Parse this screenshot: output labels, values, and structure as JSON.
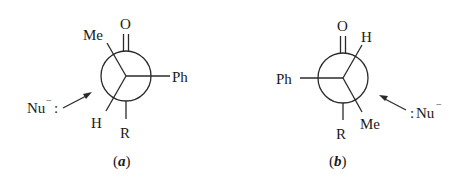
{
  "figure": {
    "panels": [
      {
        "id": "a",
        "caption_letter": "a",
        "caption_open": "(",
        "caption_close": ")",
        "front_carbon": "carbonyl (C=O)",
        "labels": {
          "top": "O",
          "back_upper_left": "Me",
          "back_right": "Ph",
          "front_lower_left": "H",
          "back_bottom": "R",
          "nucleophile": "Nu",
          "nucleophile_charge": "−",
          "nucleophile_lone_pair": ":"
        },
        "attack_direction": "from lower-left toward circle"
      },
      {
        "id": "b",
        "caption_letter": "b",
        "caption_open": "(",
        "caption_close": ")",
        "front_carbon": "carbonyl (C=O)",
        "labels": {
          "top": "O",
          "front_upper_right": "H",
          "back_left": "Ph",
          "front_lower_right": "Me",
          "back_bottom": "R",
          "nucleophile": "Nu",
          "nucleophile_charge": "−",
          "nucleophile_lone_pair": ":"
        },
        "attack_direction": "from lower-right toward circle"
      }
    ]
  }
}
